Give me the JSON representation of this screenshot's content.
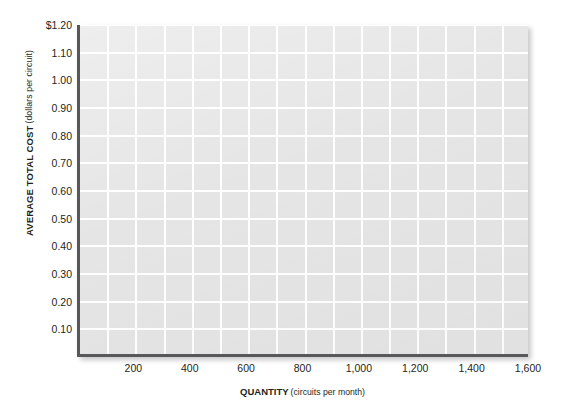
{
  "chart_data": {
    "type": "line",
    "title": "",
    "subtitle": "",
    "xlabel_main": "QUANTITY",
    "xlabel_unit": "(circuits per month)",
    "ylabel_main": "AVERAGE TOTAL COST",
    "ylabel_unit": "(dollars per circuit)",
    "xlim": [
      0,
      1600
    ],
    "ylim": [
      0,
      1.2
    ],
    "grid": true,
    "grid_color": "#ffffff",
    "plot_background": "#e5e5e5",
    "axis_color": "#58585a",
    "legend": null,
    "legend_position": "none",
    "series": [],
    "annotations": [],
    "x_ticks": [
      {
        "value": 200,
        "label": "200"
      },
      {
        "value": 400,
        "label": "400"
      },
      {
        "value": 600,
        "label": "600"
      },
      {
        "value": 800,
        "label": "800"
      },
      {
        "value": 1000,
        "label": "1,000"
      },
      {
        "value": 1200,
        "label": "1,200"
      },
      {
        "value": 1400,
        "label": "1,400"
      },
      {
        "value": 1600,
        "label": "1,600"
      }
    ],
    "x_gridlines": [
      100,
      200,
      300,
      400,
      500,
      600,
      700,
      800,
      900,
      1000,
      1100,
      1200,
      1300,
      1400,
      1500,
      1600
    ],
    "y_ticks": [
      {
        "value": 1.2,
        "label": "$1.20"
      },
      {
        "value": 1.1,
        "label": "1.10"
      },
      {
        "value": 1.0,
        "label": "1.00"
      },
      {
        "value": 0.9,
        "label": "0.90"
      },
      {
        "value": 0.8,
        "label": "0.80"
      },
      {
        "value": 0.7,
        "label": "0.70"
      },
      {
        "value": 0.6,
        "label": "0.60"
      },
      {
        "value": 0.5,
        "label": "0.50"
      },
      {
        "value": 0.4,
        "label": "0.40"
      },
      {
        "value": 0.3,
        "label": "0.30"
      },
      {
        "value": 0.2,
        "label": "0.20"
      },
      {
        "value": 0.1,
        "label": "0.10"
      }
    ],
    "y_gridlines": [
      0.1,
      0.2,
      0.3,
      0.4,
      0.5,
      0.6,
      0.7,
      0.8,
      0.9,
      1.0,
      1.1,
      1.2
    ]
  }
}
